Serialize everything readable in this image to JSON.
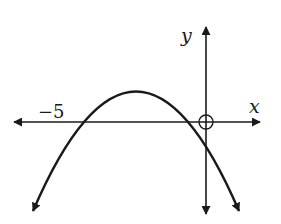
{
  "diagram": {
    "type": "function-graph",
    "axes": {
      "x_label": "x",
      "y_label": "y"
    },
    "annotations": {
      "left_intercept_label": "−5"
    },
    "curve": {
      "shape": "parabola",
      "opens": "down",
      "x_intercepts": [
        -5,
        0
      ],
      "vertex_x": -2.5,
      "open_circle_at": [
        0,
        0
      ]
    },
    "colors": {
      "stroke": "#1a1a1a",
      "background": "#ffffff"
    }
  }
}
